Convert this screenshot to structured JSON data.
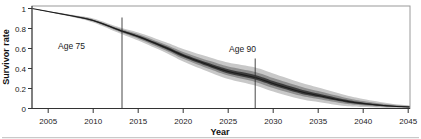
{
  "figure": {
    "background": "#ffffff",
    "bottom_edge_color": "#c9c9c9"
  },
  "chart_data": {
    "type": "area",
    "title": "",
    "xlabel": "Year",
    "ylabel": "Survivor rate",
    "xlim": [
      2003.2,
      2045.2
    ],
    "ylim": [
      0,
      1.025
    ],
    "grid": false,
    "legend": "none",
    "x_ticks": [
      2005,
      2010,
      2015,
      2020,
      2025,
      2030,
      2035,
      2040,
      2045
    ],
    "y_ticks": [
      0,
      0.2,
      0.4,
      0.6,
      0.8,
      1
    ],
    "x": [
      2003.2,
      2005,
      2008,
      2010,
      2013,
      2015,
      2018,
      2020,
      2023,
      2025,
      2028,
      2030,
      2033,
      2035,
      2038,
      2040,
      2043,
      2045.2
    ],
    "series": {
      "center": [
        1.0,
        0.97,
        0.92,
        0.88,
        0.78,
        0.72,
        0.61,
        0.53,
        0.43,
        0.37,
        0.31,
        0.25,
        0.17,
        0.13,
        0.075,
        0.05,
        0.025,
        0.015
      ],
      "upper95": [
        1.0,
        0.975,
        0.932,
        0.9,
        0.81,
        0.76,
        0.665,
        0.595,
        0.51,
        0.46,
        0.41,
        0.35,
        0.26,
        0.21,
        0.135,
        0.095,
        0.05,
        0.03
      ],
      "lower95": [
        1.0,
        0.965,
        0.908,
        0.86,
        0.75,
        0.68,
        0.56,
        0.47,
        0.36,
        0.295,
        0.23,
        0.17,
        0.095,
        0.065,
        0.025,
        0.015,
        0.005,
        0.003
      ],
      "upper80": [
        1.0,
        0.973,
        0.927,
        0.891,
        0.797,
        0.742,
        0.64,
        0.566,
        0.474,
        0.42,
        0.365,
        0.305,
        0.22,
        0.174,
        0.108,
        0.075,
        0.039,
        0.023
      ],
      "lower80": [
        1.0,
        0.967,
        0.913,
        0.869,
        0.764,
        0.698,
        0.583,
        0.497,
        0.392,
        0.329,
        0.266,
        0.206,
        0.129,
        0.094,
        0.048,
        0.031,
        0.014,
        0.008
      ],
      "upper50": [
        1.0,
        0.971,
        0.923,
        0.885,
        0.788,
        0.73,
        0.624,
        0.546,
        0.45,
        0.393,
        0.335,
        0.275,
        0.193,
        0.15,
        0.09,
        0.061,
        0.031,
        0.019
      ],
      "lower50": [
        1.0,
        0.969,
        0.917,
        0.875,
        0.773,
        0.71,
        0.598,
        0.515,
        0.413,
        0.351,
        0.29,
        0.23,
        0.151,
        0.114,
        0.063,
        0.041,
        0.02,
        0.012
      ]
    },
    "bands": [
      {
        "name": "outer-confidence-band",
        "upper": "upper95",
        "lower": "lower95",
        "color": "#c8c8c8"
      },
      {
        "name": "middle-confidence-band",
        "upper": "upper80",
        "lower": "lower80",
        "color": "#8f8f8f"
      },
      {
        "name": "inner-confidence-band",
        "upper": "upper50",
        "lower": "lower50",
        "color": "#3c3c3c"
      }
    ],
    "marker_lines": [
      {
        "name": "age-75-line",
        "x": 2013.2,
        "y_top": 0.91
      },
      {
        "name": "age-90-line",
        "x": 2028,
        "y_top": 0.5
      }
    ],
    "annotations": [
      {
        "label": "Age 75",
        "x": 2007.6,
        "y": 0.625
      },
      {
        "label": "Age 90",
        "x": 2026.6,
        "y": 0.595
      }
    ],
    "colors": {
      "band_outer": "#c8c8c8",
      "band_middle": "#8f8f8f",
      "band_inner": "#3c3c3c",
      "center_line": "#1b1b1b",
      "axis": "#333333",
      "frame": "#9a9a9a",
      "tick_label": "#222222",
      "marker_line": "#333333"
    }
  }
}
